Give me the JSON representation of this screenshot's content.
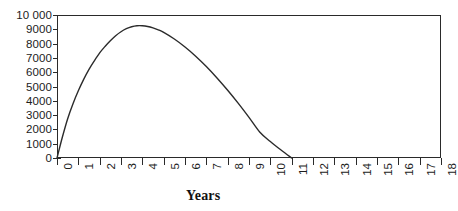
{
  "figure": {
    "background_color": "#ffffff",
    "frame_color": "#2a2a2a"
  },
  "chart_data": {
    "type": "line",
    "title": "",
    "subtitle": "",
    "xlabel": "Years",
    "ylabel": "",
    "grid": false,
    "legend": false,
    "legend_position": "none",
    "line_color": "#2b2b2b",
    "line_width": 1.4,
    "xlim": [
      0,
      18
    ],
    "ylim": [
      0,
      10000
    ],
    "xticks": [
      0,
      1,
      2,
      3,
      4,
      5,
      6,
      7,
      8,
      9,
      10,
      11,
      12,
      13,
      14,
      15,
      16,
      17,
      18
    ],
    "xticklabels": [
      "0",
      "1",
      "2",
      "3",
      "4",
      "5",
      "6",
      "7",
      "8",
      "9",
      "10",
      "11",
      "12",
      "13",
      "14",
      "15",
      "16",
      "17",
      "18"
    ],
    "xtick_rotation": 90,
    "yticks": [
      0,
      1000,
      2000,
      3000,
      4000,
      5000,
      6000,
      7000,
      8000,
      9000,
      10000
    ],
    "yticklabels": [
      "0",
      "1000",
      "2000",
      "3000",
      "4000",
      "5000",
      "6000",
      "7000",
      "8000",
      "9000",
      "10 000"
    ],
    "x": [
      0,
      0.25,
      0.5,
      0.75,
      1,
      1.25,
      1.5,
      1.75,
      2,
      2.25,
      2.5,
      2.75,
      3,
      3.25,
      3.5,
      3.75,
      4,
      4.25,
      4.5,
      4.75,
      5,
      5.5,
      6,
      6.5,
      7,
      7.5,
      8,
      8.5,
      9,
      9.5,
      10,
      10.5,
      11
    ],
    "y": [
      0,
      1450,
      2750,
      3800,
      4700,
      5500,
      6200,
      6800,
      7350,
      7800,
      8200,
      8550,
      8830,
      9040,
      9180,
      9250,
      9250,
      9200,
      9100,
      8960,
      8780,
      8320,
      7760,
      7120,
      6400,
      5600,
      4740,
      3820,
      2840,
      1820,
      1150,
      560,
      0
    ],
    "series": [
      {
        "name": "curve",
        "values": [
          0,
          1450,
          2750,
          3800,
          4700,
          5500,
          6200,
          6800,
          7350,
          7800,
          8200,
          8550,
          8830,
          9040,
          9180,
          9250,
          9250,
          9200,
          9100,
          8960,
          8780,
          8320,
          7760,
          7120,
          6400,
          5600,
          4740,
          3820,
          2840,
          1820,
          1150,
          560,
          0
        ]
      }
    ],
    "peak": {
      "x": 3.9,
      "y": 9250
    },
    "zero_crossing": {
      "x": 11,
      "y": 0
    },
    "annotations": []
  }
}
